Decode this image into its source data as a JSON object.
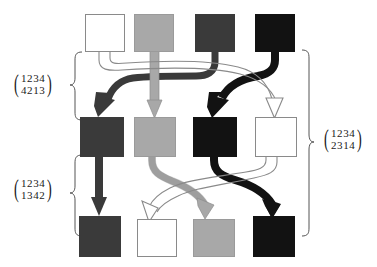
{
  "figure": {
    "type": "permutation-composition-diagram",
    "background": "#ffffff",
    "width": 377,
    "height": 267,
    "palette": {
      "white": "#ffffff",
      "light_gray": "#a8a8a8",
      "dark_gray": "#3a3a3a",
      "black": "#121212",
      "outline": "#8a8a8a",
      "text": "#1a1a1a"
    }
  },
  "labels": [
    {
      "id": "perm-top-left",
      "top": "1234",
      "bottom": "4213",
      "open_paren": "(",
      "close_paren": ")",
      "position": "left-upper",
      "describes": "mapping from row 1 to row 2"
    },
    {
      "id": "perm-bottom-left",
      "top": "1234",
      "bottom": "1342",
      "open_paren": "(",
      "close_paren": ")",
      "position": "left-lower",
      "describes": "mapping from row 2 to row 3"
    },
    {
      "id": "perm-right",
      "top": "1234",
      "bottom": "2314",
      "open_paren": "(",
      "close_paren": ")",
      "position": "right-middle",
      "describes": "composite mapping from row 1 to row 3"
    }
  ],
  "rows": [
    {
      "id": "row-top",
      "index": 1,
      "nodes": [
        {
          "col": 1,
          "fill": "white"
        },
        {
          "col": 2,
          "fill": "light_gray"
        },
        {
          "col": 3,
          "fill": "dark_gray"
        },
        {
          "col": 4,
          "fill": "black"
        }
      ]
    },
    {
      "id": "row-middle",
      "index": 2,
      "nodes": [
        {
          "col": 1,
          "fill": "dark_gray"
        },
        {
          "col": 2,
          "fill": "light_gray"
        },
        {
          "col": 3,
          "fill": "black"
        },
        {
          "col": 4,
          "fill": "white"
        }
      ]
    },
    {
      "id": "row-bottom",
      "index": 3,
      "nodes": [
        {
          "col": 1,
          "fill": "dark_gray"
        },
        {
          "col": 2,
          "fill": "white"
        },
        {
          "col": 3,
          "fill": "light_gray"
        },
        {
          "col": 4,
          "fill": "black"
        }
      ]
    }
  ],
  "arrows_top_to_middle": [
    {
      "from_col": 1,
      "to_col": 4,
      "fill": "white"
    },
    {
      "from_col": 2,
      "to_col": 2,
      "fill": "light_gray"
    },
    {
      "from_col": 3,
      "to_col": 1,
      "fill": "dark_gray"
    },
    {
      "from_col": 4,
      "to_col": 3,
      "fill": "black"
    }
  ],
  "arrows_middle_to_bottom": [
    {
      "from_col": 1,
      "to_col": 1,
      "fill": "dark_gray"
    },
    {
      "from_col": 2,
      "to_col": 3,
      "fill": "light_gray"
    },
    {
      "from_col": 3,
      "to_col": 4,
      "fill": "black"
    },
    {
      "from_col": 4,
      "to_col": 2,
      "fill": "white"
    }
  ],
  "braces": [
    {
      "id": "brace-top-left",
      "side": "left",
      "spans": "row-top to row-middle"
    },
    {
      "id": "brace-bottom-left",
      "side": "left",
      "spans": "row-middle to row-bottom"
    },
    {
      "id": "brace-right",
      "side": "right",
      "spans": "row-top to row-bottom"
    }
  ]
}
